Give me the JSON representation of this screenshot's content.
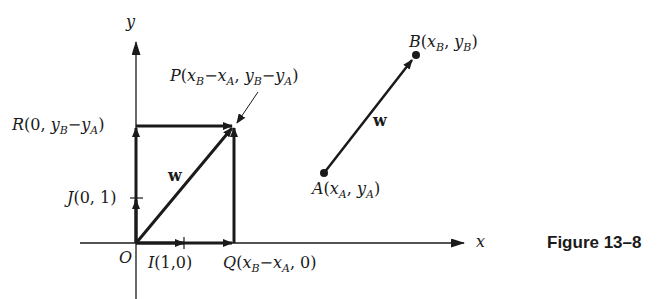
{
  "figure": {
    "caption": "Figure 13–8",
    "axes": {
      "x_label": "x",
      "y_label": "y",
      "origin_label": "O"
    },
    "points": {
      "P": {
        "name": "P",
        "coords": "(xB−xA, yB−yA)"
      },
      "R": {
        "name": "R",
        "coords": "(0, yB−yA)"
      },
      "J": {
        "name": "J",
        "coords": "(0, 1)"
      },
      "I": {
        "name": "I",
        "coords": "(1,0)"
      },
      "Q": {
        "name": "Q",
        "coords": "(xB−xA, 0)"
      },
      "A": {
        "name": "A",
        "coords": "(xA, yA)"
      },
      "B": {
        "name": "B",
        "coords": "(xB, yB)"
      }
    },
    "vector_label": "w",
    "colors": {
      "ink": "#1a1a1a",
      "background": "#ffffff"
    }
  }
}
